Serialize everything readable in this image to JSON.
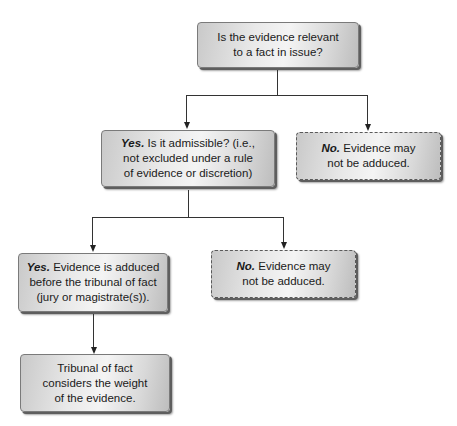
{
  "diagram": {
    "type": "flowchart",
    "nodes": {
      "relevant": {
        "text": "Is the evidence relevant to a fact in issue?",
        "line1": "Is the evidence relevant",
        "line2": "to a fact in issue?"
      },
      "admissible": {
        "bold": "Yes.",
        "line1": " Is it admissible? (i.e.,",
        "line2": "not excluded under a rule",
        "line3": "of evidence or discretion)"
      },
      "not_relevant": {
        "bold": "No.",
        "line1": " Evidence may",
        "line2": "not be adduced."
      },
      "adduced": {
        "bold": "Yes.",
        "line1": " Evidence is adduced",
        "line2": "before the tribunal of fact",
        "line3": "(jury or magistrate(s))."
      },
      "not_admissible": {
        "bold": "No.",
        "line1": " Evidence may",
        "line2": "not be adduced."
      },
      "weight": {
        "line1": "Tribunal of fact",
        "line2": "considers the weight",
        "line3": "of the evidence."
      }
    },
    "edges": [
      {
        "from": "relevant",
        "to": "admissible",
        "label": "Yes"
      },
      {
        "from": "relevant",
        "to": "not_relevant",
        "label": "No"
      },
      {
        "from": "admissible",
        "to": "adduced",
        "label": "Yes"
      },
      {
        "from": "admissible",
        "to": "not_admissible",
        "label": "No"
      },
      {
        "from": "adduced",
        "to": "weight"
      }
    ],
    "colors": {
      "box_fill": "#e6e6e6",
      "box_border": "#7a7a7a",
      "line": "#333333"
    }
  }
}
